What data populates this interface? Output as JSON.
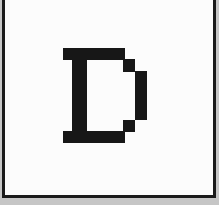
{
  "window": {
    "description": "Magnified bitmap glyph preview panel with dark frame on gray background"
  },
  "colors": {
    "outer_background": "#c6c6c6",
    "frame_border": "#1a1a1a",
    "panel_background": "#fcfcfc",
    "glyph": "#171717"
  },
  "glyph": {
    "character": "D",
    "style": "pixelated bitmap serif capital letter",
    "color": "#171717",
    "rects": [
      {
        "name": "top-bar",
        "x": 63,
        "y": 48,
        "w": 62,
        "h": 12
      },
      {
        "name": "left-stem",
        "x": 72,
        "y": 48,
        "w": 15,
        "h": 95
      },
      {
        "name": "top-step",
        "x": 123,
        "y": 59,
        "w": 12,
        "h": 13
      },
      {
        "name": "right-bar",
        "x": 135,
        "y": 71,
        "w": 12,
        "h": 49
      },
      {
        "name": "bottom-step",
        "x": 123,
        "y": 120,
        "w": 12,
        "h": 12
      },
      {
        "name": "bottom-bar",
        "x": 63,
        "y": 131,
        "w": 62,
        "h": 12
      }
    ]
  }
}
